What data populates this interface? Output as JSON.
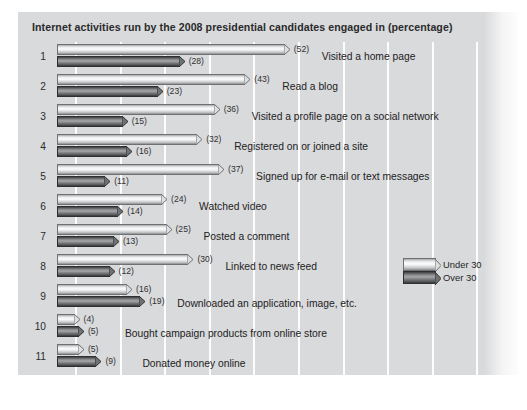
{
  "chart_data": {
    "type": "bar",
    "title": "Internet activities run by the 2008 presidential candidates engaged in (percentage)",
    "xlabel": "",
    "ylabel": "",
    "xlim": [
      0,
      55
    ],
    "grid": true,
    "orientation": "horizontal",
    "legend_position": "middle-right",
    "categories": [
      "Visited a home page",
      "Read a blog",
      "Visited a profile page on a social network",
      "Registered on or joined a site",
      "Signed up for e-mail or text messages",
      "Watched video",
      "Posted a comment",
      "Linked to news feed",
      "Downloaded an application, image, etc.",
      "Bought campaign products from online store",
      "Donated money online"
    ],
    "row_numbers": [
      "1",
      "2",
      "3",
      "4",
      "5",
      "6",
      "7",
      "8",
      "9",
      "10",
      "11"
    ],
    "series": [
      {
        "name": "Under 30",
        "color": "#f2f3f3",
        "values": [
          52,
          43,
          36,
          32,
          37,
          24,
          25,
          30,
          16,
          4,
          5
        ],
        "value_labels": [
          "(52)",
          "(43)",
          "(36)",
          "(32)",
          "(37)",
          "(24)",
          "(25)",
          "(30)",
          "(16)",
          "(4)",
          "(5)"
        ]
      },
      {
        "name": "Over 30",
        "color": "#5a5c5e",
        "values": [
          28,
          23,
          15,
          16,
          11,
          14,
          13,
          12,
          19,
          5,
          9
        ],
        "value_labels": [
          "(28)",
          "(23)",
          "(15)",
          "(16)",
          "(11)",
          "(14)",
          "(13)",
          "(12)",
          "(19)",
          "(5)",
          "(9)"
        ]
      }
    ],
    "legend": [
      {
        "label": "Under 30",
        "swatch": "light-cylinder-bar"
      },
      {
        "label": "Over 30",
        "swatch": "dark-cylinder-bar"
      }
    ],
    "colors": {
      "panel_background": "#d9dadb",
      "gridline": "#fdfdfd",
      "text": "#222224"
    }
  }
}
